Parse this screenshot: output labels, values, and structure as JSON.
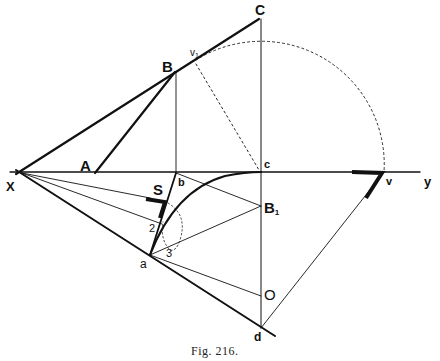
{
  "figure": {
    "caption": "Fig. 216.",
    "ink_color": "#111111",
    "background": "#ffffff"
  },
  "labels": {
    "X": "X",
    "y": "y",
    "A": "A",
    "B": "B",
    "C": "C",
    "v1": "v",
    "v1_sub": "1",
    "b": "b",
    "c": "c",
    "v": "v",
    "S": "S",
    "B1": "B",
    "B1_sub": "1",
    "two": "2",
    "three": "3",
    "a": "a",
    "O": "O",
    "d": "d"
  },
  "points": {
    "X": [
      22,
      173
    ],
    "A": [
      95,
      173
    ],
    "B": [
      175,
      72
    ],
    "C": [
      259,
      19
    ],
    "b": [
      176,
      173
    ],
    "c": [
      261,
      172
    ],
    "v": [
      384,
      172
    ],
    "v1": [
      196,
      60
    ],
    "B1": [
      261,
      206
    ],
    "O": [
      261,
      296
    ],
    "d": [
      261,
      328
    ],
    "a": [
      150,
      255
    ],
    "p2": [
      163,
      220
    ],
    "p3": [
      170,
      248
    ]
  }
}
